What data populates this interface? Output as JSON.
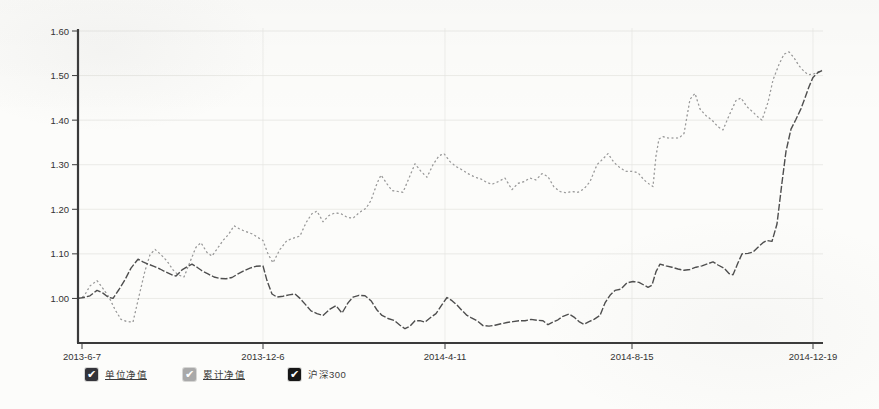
{
  "colors": {
    "background": "#fcfcfa",
    "axis": "#3a3a3a",
    "grid_h": "#e2e2de",
    "grid_v": "#e7e7e3",
    "text": "#333333"
  },
  "legend": {
    "items": [
      {
        "key": "unit-nav",
        "label": "单位净值",
        "checked": true,
        "checkbox_color": "#34343a",
        "underline": true
      },
      {
        "key": "cumulative-nav",
        "label": "累计净值",
        "checked": true,
        "checkbox_color": "#a9a9a9",
        "underline": true
      },
      {
        "key": "csi300",
        "label": "沪深300",
        "checked": true,
        "checkbox_color": "#161616",
        "underline": false
      }
    ]
  },
  "chart_data": {
    "type": "line",
    "title": "",
    "xlabel": "",
    "ylabel": "",
    "grid": true,
    "ylim": [
      0.9,
      1.6
    ],
    "y_ticks": [
      {
        "label": "1.60",
        "value": 1.6
      },
      {
        "label": "1.50",
        "value": 1.5
      },
      {
        "label": "1.40",
        "value": 1.4
      },
      {
        "label": "1.30",
        "value": 1.3
      },
      {
        "label": "1.20",
        "value": 1.2
      },
      {
        "label": "1.10",
        "value": 1.1
      },
      {
        "label": "1.00",
        "value": 1.0
      }
    ],
    "x_ticks": [
      {
        "label": "2013-6-7",
        "px": 82
      },
      {
        "label": "2013-12-6",
        "px": 263
      },
      {
        "label": "2014-4-11",
        "px": 445
      },
      {
        "label": "2014-8-15",
        "px": 632
      },
      {
        "label": "2014-12-19",
        "px": 813
      }
    ],
    "series": [
      {
        "name": "累计净值",
        "key": "cumulative-nav",
        "color": "#b9b9b9",
        "width": 1.0,
        "dash": "1.5,3",
        "points": 1
      },
      {
        "name": "单位净值",
        "key": "unit-nav",
        "color": "#9b9b9b",
        "width": 1.2,
        "dash": "2,2.5",
        "points": [
          [
            78,
            1.0
          ],
          [
            84,
            1.005
          ],
          [
            90,
            1.028
          ],
          [
            97,
            1.04
          ],
          [
            103,
            1.022
          ],
          [
            109,
            1.003
          ],
          [
            115,
            0.975
          ],
          [
            121,
            0.953
          ],
          [
            127,
            0.948
          ],
          [
            133,
            0.947
          ],
          [
            139,
            1.005
          ],
          [
            145,
            1.062
          ],
          [
            150,
            1.098
          ],
          [
            155,
            1.11
          ],
          [
            161,
            1.098
          ],
          [
            167,
            1.084
          ],
          [
            173,
            1.064
          ],
          [
            178,
            1.053
          ],
          [
            184,
            1.048
          ],
          [
            190,
            1.082
          ],
          [
            196,
            1.115
          ],
          [
            201,
            1.125
          ],
          [
            207,
            1.103
          ],
          [
            212,
            1.095
          ],
          [
            218,
            1.114
          ],
          [
            223,
            1.13
          ],
          [
            229,
            1.145
          ],
          [
            234,
            1.163
          ],
          [
            240,
            1.155
          ],
          [
            246,
            1.15
          ],
          [
            252,
            1.145
          ],
          [
            257,
            1.138
          ],
          [
            263,
            1.13
          ],
          [
            268,
            1.1
          ],
          [
            273,
            1.08
          ],
          [
            280,
            1.11
          ],
          [
            287,
            1.13
          ],
          [
            293,
            1.135
          ],
          [
            300,
            1.14
          ],
          [
            306,
            1.17
          ],
          [
            312,
            1.19
          ],
          [
            317,
            1.196
          ],
          [
            323,
            1.172
          ],
          [
            329,
            1.186
          ],
          [
            335,
            1.192
          ],
          [
            341,
            1.19
          ],
          [
            347,
            1.182
          ],
          [
            353,
            1.18
          ],
          [
            360,
            1.194
          ],
          [
            366,
            1.202
          ],
          [
            371,
            1.22
          ],
          [
            377,
            1.258
          ],
          [
            381,
            1.277
          ],
          [
            387,
            1.257
          ],
          [
            392,
            1.242
          ],
          [
            398,
            1.24
          ],
          [
            403,
            1.238
          ],
          [
            409,
            1.27
          ],
          [
            415,
            1.302
          ],
          [
            421,
            1.285
          ],
          [
            427,
            1.272
          ],
          [
            433,
            1.3
          ],
          [
            439,
            1.32
          ],
          [
            444,
            1.325
          ],
          [
            450,
            1.307
          ],
          [
            456,
            1.296
          ],
          [
            461,
            1.29
          ],
          [
            468,
            1.28
          ],
          [
            475,
            1.272
          ],
          [
            481,
            1.268
          ],
          [
            487,
            1.26
          ],
          [
            492,
            1.256
          ],
          [
            498,
            1.262
          ],
          [
            505,
            1.27
          ],
          [
            512,
            1.244
          ],
          [
            518,
            1.258
          ],
          [
            524,
            1.262
          ],
          [
            530,
            1.27
          ],
          [
            536,
            1.266
          ],
          [
            542,
            1.28
          ],
          [
            548,
            1.273
          ],
          [
            554,
            1.25
          ],
          [
            560,
            1.24
          ],
          [
            566,
            1.237
          ],
          [
            572,
            1.24
          ],
          [
            578,
            1.238
          ],
          [
            584,
            1.246
          ],
          [
            590,
            1.262
          ],
          [
            597,
            1.3
          ],
          [
            603,
            1.313
          ],
          [
            608,
            1.325
          ],
          [
            614,
            1.305
          ],
          [
            620,
            1.293
          ],
          [
            626,
            1.285
          ],
          [
            632,
            1.285
          ],
          [
            638,
            1.282
          ],
          [
            644,
            1.266
          ],
          [
            649,
            1.257
          ],
          [
            653,
            1.251
          ],
          [
            656,
            1.32
          ],
          [
            659,
            1.358
          ],
          [
            663,
            1.363
          ],
          [
            668,
            1.36
          ],
          [
            674,
            1.36
          ],
          [
            679,
            1.36
          ],
          [
            684,
            1.37
          ],
          [
            690,
            1.447
          ],
          [
            695,
            1.46
          ],
          [
            700,
            1.425
          ],
          [
            706,
            1.41
          ],
          [
            712,
            1.4
          ],
          [
            718,
            1.385
          ],
          [
            723,
            1.378
          ],
          [
            729,
            1.41
          ],
          [
            736,
            1.444
          ],
          [
            741,
            1.45
          ],
          [
            747,
            1.43
          ],
          [
            753,
            1.418
          ],
          [
            758,
            1.407
          ],
          [
            762,
            1.4
          ],
          [
            768,
            1.44
          ],
          [
            773,
            1.49
          ],
          [
            779,
            1.525
          ],
          [
            784,
            1.548
          ],
          [
            789,
            1.553
          ],
          [
            794,
            1.54
          ],
          [
            799,
            1.522
          ],
          [
            803,
            1.512
          ],
          [
            808,
            1.502
          ],
          [
            813,
            1.503
          ],
          [
            818,
            1.508
          ],
          [
            822,
            1.512
          ]
        ]
      },
      {
        "name": "沪深300",
        "key": "csi300",
        "color": "#4e4e4e",
        "width": 1.4,
        "dash": "7,2",
        "points": [
          [
            78,
            1.0
          ],
          [
            84,
            1.002
          ],
          [
            90,
            1.006
          ],
          [
            97,
            1.018
          ],
          [
            103,
            1.012
          ],
          [
            108,
            1.003
          ],
          [
            113,
            1.0
          ],
          [
            119,
            1.02
          ],
          [
            125,
            1.042
          ],
          [
            131,
            1.068
          ],
          [
            138,
            1.088
          ],
          [
            143,
            1.082
          ],
          [
            148,
            1.077
          ],
          [
            154,
            1.072
          ],
          [
            160,
            1.066
          ],
          [
            166,
            1.059
          ],
          [
            172,
            1.053
          ],
          [
            176,
            1.05
          ],
          [
            182,
            1.064
          ],
          [
            188,
            1.072
          ],
          [
            192,
            1.077
          ],
          [
            197,
            1.07
          ],
          [
            202,
            1.062
          ],
          [
            208,
            1.055
          ],
          [
            214,
            1.048
          ],
          [
            220,
            1.045
          ],
          [
            226,
            1.044
          ],
          [
            232,
            1.047
          ],
          [
            238,
            1.055
          ],
          [
            244,
            1.062
          ],
          [
            250,
            1.068
          ],
          [
            256,
            1.072
          ],
          [
            263,
            1.073
          ],
          [
            267,
            1.04
          ],
          [
            272,
            1.01
          ],
          [
            277,
            1.003
          ],
          [
            283,
            1.005
          ],
          [
            289,
            1.008
          ],
          [
            295,
            1.01
          ],
          [
            300,
            1.0
          ],
          [
            306,
            0.985
          ],
          [
            311,
            0.972
          ],
          [
            317,
            0.966
          ],
          [
            323,
            0.962
          ],
          [
            330,
            0.976
          ],
          [
            336,
            0.984
          ],
          [
            342,
            0.967
          ],
          [
            348,
            0.99
          ],
          [
            353,
            1.003
          ],
          [
            359,
            1.007
          ],
          [
            365,
            1.006
          ],
          [
            371,
            0.995
          ],
          [
            377,
            0.974
          ],
          [
            382,
            0.962
          ],
          [
            388,
            0.955
          ],
          [
            394,
            0.951
          ],
          [
            400,
            0.94
          ],
          [
            405,
            0.932
          ],
          [
            410,
            0.938
          ],
          [
            415,
            0.95
          ],
          [
            420,
            0.95
          ],
          [
            425,
            0.947
          ],
          [
            430,
            0.956
          ],
          [
            436,
            0.966
          ],
          [
            442,
            0.986
          ],
          [
            447,
            1.002
          ],
          [
            452,
            0.995
          ],
          [
            457,
            0.985
          ],
          [
            462,
            0.973
          ],
          [
            467,
            0.962
          ],
          [
            471,
            0.957
          ],
          [
            477,
            0.95
          ],
          [
            483,
            0.939
          ],
          [
            489,
            0.938
          ],
          [
            495,
            0.94
          ],
          [
            501,
            0.943
          ],
          [
            507,
            0.946
          ],
          [
            513,
            0.948
          ],
          [
            519,
            0.95
          ],
          [
            525,
            0.95
          ],
          [
            531,
            0.953
          ],
          [
            537,
            0.951
          ],
          [
            543,
            0.95
          ],
          [
            548,
            0.941
          ],
          [
            553,
            0.947
          ],
          [
            558,
            0.952
          ],
          [
            563,
            0.96
          ],
          [
            569,
            0.965
          ],
          [
            574,
            0.958
          ],
          [
            579,
            0.948
          ],
          [
            584,
            0.942
          ],
          [
            589,
            0.948
          ],
          [
            594,
            0.953
          ],
          [
            600,
            0.962
          ],
          [
            605,
            0.99
          ],
          [
            610,
            1.007
          ],
          [
            615,
            1.018
          ],
          [
            621,
            1.021
          ],
          [
            627,
            1.035
          ],
          [
            633,
            1.038
          ],
          [
            639,
            1.036
          ],
          [
            644,
            1.03
          ],
          [
            648,
            1.025
          ],
          [
            652,
            1.03
          ],
          [
            656,
            1.06
          ],
          [
            660,
            1.077
          ],
          [
            666,
            1.073
          ],
          [
            672,
            1.07
          ],
          [
            678,
            1.066
          ],
          [
            684,
            1.063
          ],
          [
            690,
            1.065
          ],
          [
            696,
            1.07
          ],
          [
            702,
            1.073
          ],
          [
            708,
            1.078
          ],
          [
            713,
            1.082
          ],
          [
            718,
            1.075
          ],
          [
            724,
            1.068
          ],
          [
            729,
            1.056
          ],
          [
            733,
            1.053
          ],
          [
            738,
            1.08
          ],
          [
            742,
            1.1
          ],
          [
            748,
            1.101
          ],
          [
            753,
            1.104
          ],
          [
            758,
            1.115
          ],
          [
            763,
            1.125
          ],
          [
            767,
            1.13
          ],
          [
            772,
            1.128
          ],
          [
            777,
            1.167
          ],
          [
            782,
            1.26
          ],
          [
            786,
            1.33
          ],
          [
            791,
            1.38
          ],
          [
            796,
            1.402
          ],
          [
            801,
            1.426
          ],
          [
            805,
            1.45
          ],
          [
            809,
            1.475
          ],
          [
            813,
            1.496
          ],
          [
            818,
            1.507
          ],
          [
            822,
            1.511
          ]
        ]
      }
    ]
  }
}
